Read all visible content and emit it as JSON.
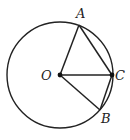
{
  "figure": {
    "type": "geometry",
    "stroke_color": "#222222",
    "background": "#ffffff",
    "circle": {
      "center": "O",
      "cx": 60,
      "cy": 75,
      "r": 53
    },
    "points": [
      {
        "id": "O",
        "label": "O",
        "x": 60,
        "y": 75,
        "lx": 41,
        "ly": 80
      },
      {
        "id": "A",
        "label": "A",
        "x": 79,
        "y": 25,
        "lx": 76,
        "ly": 18
      },
      {
        "id": "C",
        "label": "C",
        "x": 112,
        "y": 75,
        "lx": 115,
        "ly": 80
      },
      {
        "id": "B",
        "label": "B",
        "x": 100,
        "y": 110,
        "lx": 101,
        "ly": 123
      }
    ],
    "segments": [
      [
        "O",
        "A"
      ],
      [
        "O",
        "C"
      ],
      [
        "O",
        "B"
      ],
      [
        "A",
        "C"
      ],
      [
        "C",
        "B"
      ]
    ]
  }
}
